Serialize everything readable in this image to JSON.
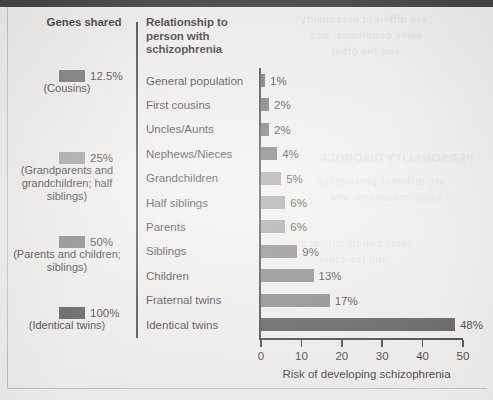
{
  "figure": {
    "background_color": "#eeece9",
    "ink_color": "#17161a"
  },
  "columns": {
    "genes_header": "Genes shared",
    "relationship_header": "Relationship to person with schizophrenia"
  },
  "legend": {
    "title": "Genes shared",
    "entries": [
      {
        "percent": "12.5%",
        "detail": "(Cousins)",
        "color": "#5a5a5c",
        "top": 70
      },
      {
        "percent": "25%",
        "detail": "(Grandparents and grandchildren; half siblings)",
        "color": "#8e8e90",
        "top": 152
      },
      {
        "percent": "50%",
        "detail": "(Parents and children; siblings)",
        "color": "#6e6e70",
        "top": 236
      },
      {
        "percent": "100%",
        "detail": "(Identical twins)",
        "color": "#3c3c3e",
        "top": 307
      }
    ]
  },
  "chart_data": {
    "type": "bar",
    "orientation": "horizontal",
    "title": "",
    "xlabel": "Risk of developing schizophrenia",
    "ylabel": "",
    "xlim": [
      0,
      50
    ],
    "xticks": [
      0,
      10,
      20,
      30,
      40,
      50
    ],
    "grid": false,
    "legend_position": "left",
    "categories": [
      "General population",
      "First cousins",
      "Uncles/Aunts",
      "Nephews/Nieces",
      "Grandchildren",
      "Half siblings",
      "Parents",
      "Siblings",
      "Children",
      "Fraternal twins",
      "Identical twins"
    ],
    "values": [
      1,
      2,
      2,
      4,
      5,
      6,
      6,
      9,
      13,
      17,
      48
    ],
    "value_labels": [
      "1%",
      "2%",
      "2%",
      "4%",
      "5%",
      "6%",
      "6%",
      "9%",
      "13%",
      "17%",
      "48%"
    ],
    "bar_colors": [
      "#5a5a5c",
      "#5a5a5c",
      "#5a5a5c",
      "#5a5a5c",
      "#8e8e90",
      "#8e8e90",
      "#8e8e90",
      "#6e6e70",
      "#6e6e70",
      "#6e6e70",
      "#3c3c3e"
    ],
    "genes_shared_group": [
      "12.5%",
      "12.5%",
      "12.5%",
      "12.5%",
      "25%",
      "25%",
      "25%",
      "50%",
      "50%",
      "50%",
      "100%"
    ]
  },
  "ghost_text": {
    "line_a": "PERSONALITY DISORDER",
    "line_b": "are different personality",
    "line_c": "same conditions, and",
    "line_d": "and the other"
  }
}
